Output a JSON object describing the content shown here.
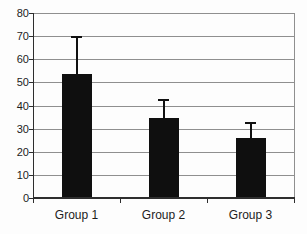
{
  "chart_data": {
    "type": "bar",
    "title": "",
    "xlabel": "",
    "ylabel": "",
    "categories": [
      "Group 1",
      "Group 2",
      "Group 3"
    ],
    "values": [
      53.5,
      34.5,
      26
    ],
    "error_upper": [
      16.5,
      8.5,
      7
    ],
    "ylim": [
      0,
      80
    ],
    "ytick_interval": 10,
    "ytick_labels": [
      "0",
      "10",
      "20",
      "30",
      "40",
      "50",
      "60",
      "70",
      "80"
    ],
    "grid": true,
    "legend_position": "none",
    "colors": {
      "bar": "#0f0f0f",
      "gridline": "#8f8f8f",
      "plot_border": "#8f8f8f",
      "axis": "#2e2e2e",
      "error_bar": "#111111",
      "text": "#1c1c1c",
      "background": "#fdfdfd"
    }
  }
}
